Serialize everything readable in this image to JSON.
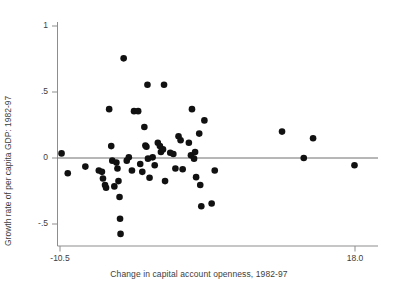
{
  "chart_data": {
    "type": "scatter",
    "title": "",
    "xlabel": "Change in capital account openness, 1982-97",
    "ylabel": "Growth rate of per capita GDP: 1982-97",
    "xlim": [
      -10.5,
      18.0
    ],
    "ylim": [
      -0.62,
      1.0
    ],
    "xticks": [
      -10.5,
      18.0
    ],
    "xticklabels": [
      "-10.5",
      "18.0"
    ],
    "yticks": [
      -0.5,
      0,
      0.5,
      1
    ],
    "yticklabels": [
      "-.5",
      "0",
      ".5",
      "1"
    ],
    "grid": false,
    "legend": null,
    "reference_lines": [
      {
        "orientation": "horizontal",
        "y": 0,
        "color": "#6e6e6e"
      }
    ],
    "marker": {
      "shape": "circle",
      "color": "#111111",
      "size": 3.3
    },
    "points": [
      {
        "x": -10.35,
        "y": 0.035
      },
      {
        "x": -9.75,
        "y": -0.115
      },
      {
        "x": -8.05,
        "y": -0.065
      },
      {
        "x": -6.75,
        "y": -0.095
      },
      {
        "x": -6.45,
        "y": -0.105
      },
      {
        "x": -6.35,
        "y": -0.155
      },
      {
        "x": -6.15,
        "y": -0.205
      },
      {
        "x": -6.05,
        "y": -0.225
      },
      {
        "x": -5.75,
        "y": 0.37
      },
      {
        "x": -5.55,
        "y": 0.09
      },
      {
        "x": -5.45,
        "y": -0.02
      },
      {
        "x": -5.25,
        "y": -0.215
      },
      {
        "x": -5.05,
        "y": -0.035
      },
      {
        "x": -4.95,
        "y": -0.08
      },
      {
        "x": -4.85,
        "y": -0.175
      },
      {
        "x": -4.75,
        "y": -0.295
      },
      {
        "x": -4.7,
        "y": -0.46
      },
      {
        "x": -4.65,
        "y": -0.575
      },
      {
        "x": -4.35,
        "y": 0.755
      },
      {
        "x": -4.05,
        "y": -0.02
      },
      {
        "x": -3.85,
        "y": 0.005
      },
      {
        "x": -3.55,
        "y": -0.095
      },
      {
        "x": -3.35,
        "y": 0.355
      },
      {
        "x": -2.95,
        "y": 0.355
      },
      {
        "x": -2.75,
        "y": -0.045
      },
      {
        "x": -2.55,
        "y": -0.105
      },
      {
        "x": -2.35,
        "y": 0.235
      },
      {
        "x": -2.25,
        "y": 0.095
      },
      {
        "x": -2.15,
        "y": 0.085
      },
      {
        "x": -2.05,
        "y": 0.555
      },
      {
        "x": -2.0,
        "y": -0.005
      },
      {
        "x": -1.85,
        "y": -0.15
      },
      {
        "x": -1.55,
        "y": 0.005
      },
      {
        "x": -1.35,
        "y": -0.055
      },
      {
        "x": -1.05,
        "y": 0.115
      },
      {
        "x": -0.85,
        "y": 0.09
      },
      {
        "x": -0.75,
        "y": 0.045
      },
      {
        "x": -0.55,
        "y": 0.065
      },
      {
        "x": -0.45,
        "y": 0.555
      },
      {
        "x": -0.35,
        "y": -0.175
      },
      {
        "x": 0.15,
        "y": 0.04
      },
      {
        "x": 0.45,
        "y": 0.03
      },
      {
        "x": 0.65,
        "y": -0.08
      },
      {
        "x": 0.95,
        "y": 0.165
      },
      {
        "x": 1.15,
        "y": 0.135
      },
      {
        "x": 1.35,
        "y": -0.085
      },
      {
        "x": 1.95,
        "y": 0.115
      },
      {
        "x": 2.15,
        "y": 0.02
      },
      {
        "x": 2.25,
        "y": 0.37
      },
      {
        "x": 2.45,
        "y": -0.005
      },
      {
        "x": 2.55,
        "y": 0.045
      },
      {
        "x": 2.65,
        "y": -0.145
      },
      {
        "x": 2.95,
        "y": 0.185
      },
      {
        "x": 3.05,
        "y": -0.205
      },
      {
        "x": 3.15,
        "y": -0.365
      },
      {
        "x": 3.45,
        "y": 0.285
      },
      {
        "x": 4.15,
        "y": -0.345
      },
      {
        "x": 4.45,
        "y": -0.095
      },
      {
        "x": 10.95,
        "y": 0.2
      },
      {
        "x": 13.05,
        "y": 0.0
      },
      {
        "x": 13.95,
        "y": 0.15
      },
      {
        "x": 17.95,
        "y": -0.055
      }
    ]
  }
}
